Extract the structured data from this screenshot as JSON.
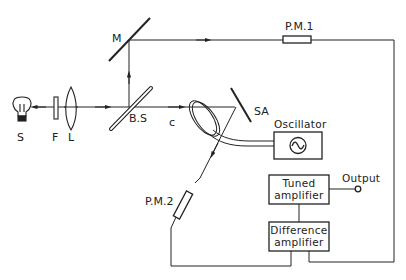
{
  "diagram": {
    "type": "optical-experimental-setup",
    "colors": {
      "line": "#222222",
      "background": "#ffffff"
    },
    "components": {
      "source": {
        "label": "S",
        "icon": "lightbulb-icon"
      },
      "filter": {
        "label": "F"
      },
      "lens": {
        "label": "L"
      },
      "beam_splitter": {
        "label": "B.S"
      },
      "mirror": {
        "label": "M"
      },
      "photomultiplier_1": {
        "label": "P.M.1"
      },
      "photomultiplier_2": {
        "label": "P.M.2"
      },
      "sample": {
        "label": "SA"
      },
      "coil": {
        "label": "c"
      },
      "oscillator": {
        "label": "Oscillator",
        "icon": "sine-wave-icon"
      },
      "tuned_amplifier": {
        "line1": "Tuned",
        "line2": "amplifier"
      },
      "difference_amplifier": {
        "line1": "Difference",
        "line2": "amplifier"
      },
      "output": {
        "label": "Output"
      }
    }
  }
}
